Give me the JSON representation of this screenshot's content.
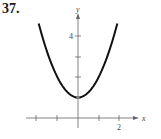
{
  "problem": {
    "number": "37."
  },
  "chart_data": {
    "type": "line",
    "title": "",
    "xlabel": "x",
    "ylabel": "y",
    "function": "y = x^2 + 1",
    "xlim": [
      -2.5,
      2.9
    ],
    "ylim": [
      -0.5,
      5.2
    ],
    "x_ticks": [
      -2,
      -1,
      0,
      1,
      2
    ],
    "x_tick_labels": {
      "2": "2"
    },
    "y_ticks": [
      1,
      2,
      3,
      4
    ],
    "y_tick_labels": {
      "4": "4"
    },
    "grid": false,
    "legend": null,
    "series": [
      {
        "name": "parabola",
        "x": [
          -1.9,
          -1.5,
          -1,
          -0.5,
          0,
          0.5,
          1,
          1.5,
          1.9
        ],
        "y": [
          4.61,
          3.25,
          2,
          1.25,
          1,
          1.25,
          2,
          3.25,
          4.61
        ]
      }
    ],
    "vertex": {
      "x": 0,
      "y": 1
    }
  },
  "labels": {
    "x_axis": "x",
    "y_axis": "y",
    "x_tick_2": "2",
    "y_tick_4": "4"
  }
}
